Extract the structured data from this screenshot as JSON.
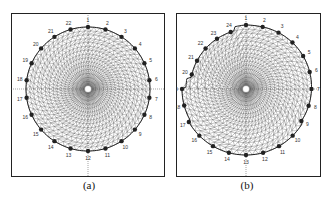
{
  "figure": {
    "panels": [
      {
        "id": "a",
        "caption": "(a)",
        "shape": "circle",
        "electrode_count": 22,
        "electrode_labels": [
          "1",
          "2",
          "3",
          "4",
          "5",
          "6",
          "7",
          "8",
          "9",
          "10",
          "11",
          "12",
          "13",
          "14",
          "15",
          "16",
          "17",
          "18",
          "19",
          "20",
          "21",
          "22"
        ]
      },
      {
        "id": "b",
        "caption": "(b)",
        "shape": "irregular",
        "electrode_count": 24,
        "electrode_labels": [
          "1",
          "2",
          "3",
          "4",
          "5",
          "6",
          "7",
          "8",
          "9",
          "10",
          "11",
          "12",
          "13",
          "14",
          "15",
          "16",
          "17",
          "18",
          "19",
          "20",
          "21",
          "22",
          "23",
          "24"
        ]
      }
    ],
    "colors": {
      "frame": "#222222",
      "mesh": "#555555",
      "electrode": "#222222",
      "axis": "#444444"
    }
  }
}
